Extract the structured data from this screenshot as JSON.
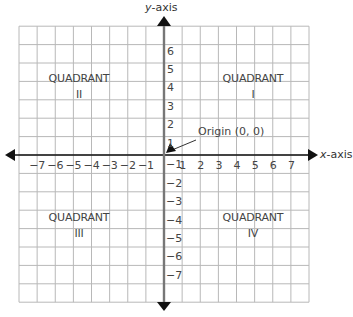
{
  "diagram": {
    "type": "coordinate-plane",
    "x_axis_label": {
      "var": "x",
      "suffix": "-axis"
    },
    "y_axis_label": {
      "var": "y",
      "suffix": "-axis"
    },
    "x_ticks": [
      "−7",
      "−6",
      "−5",
      "−4",
      "−3",
      "−2",
      "−1",
      "1",
      "2",
      "3",
      "4",
      "5",
      "6",
      "7"
    ],
    "y_ticks_positive": [
      "6",
      "5",
      "4",
      "3",
      "2",
      "1"
    ],
    "y_ticks_negative": [
      "−1",
      "−2",
      "−3",
      "−4",
      "−5",
      "−6",
      "−7"
    ],
    "origin_label": "Origin (0, 0)",
    "quadrants": [
      {
        "title": "QUADRANT",
        "numeral": "I"
      },
      {
        "title": "QUADRANT",
        "numeral": "II"
      },
      {
        "title": "QUADRANT",
        "numeral": "III"
      },
      {
        "title": "QUADRANT",
        "numeral": "IV"
      }
    ],
    "grid": {
      "x_range": [
        -8,
        8
      ],
      "y_range": [
        -8,
        7
      ]
    },
    "colors": {
      "grid": "#b8b8b8",
      "x_axis": "#111111",
      "y_axis": "#777777",
      "arrow": "#111111"
    }
  }
}
